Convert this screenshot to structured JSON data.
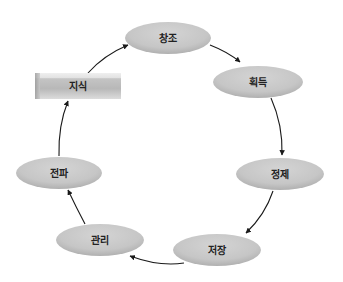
{
  "diagram": {
    "start_node": {
      "id": "knowledge",
      "label": "지식",
      "shape": "beveled-box",
      "x": 35,
      "y": 73,
      "w": 86,
      "h": 26
    },
    "cycle_nodes": [
      {
        "id": "creation",
        "label": "창조",
        "cx": 168,
        "cy": 38,
        "rx": 43,
        "ry": 16
      },
      {
        "id": "acquisition",
        "label": "획득",
        "cx": 258,
        "cy": 82,
        "rx": 45,
        "ry": 16
      },
      {
        "id": "refinement",
        "label": "정제",
        "cx": 280,
        "cy": 174,
        "rx": 44,
        "ry": 16
      },
      {
        "id": "storage",
        "label": "저장",
        "cx": 217,
        "cy": 250,
        "rx": 44,
        "ry": 16
      },
      {
        "id": "management",
        "label": "관리",
        "cx": 100,
        "cy": 240,
        "rx": 44,
        "ry": 16
      },
      {
        "id": "distribution",
        "label": "전파",
        "cx": 59,
        "cy": 173,
        "rx": 43,
        "ry": 16
      }
    ],
    "edges": [
      {
        "from": "knowledge",
        "to": "creation"
      },
      {
        "from": "creation",
        "to": "acquisition"
      },
      {
        "from": "acquisition",
        "to": "refinement"
      },
      {
        "from": "refinement",
        "to": "storage"
      },
      {
        "from": "storage",
        "to": "management"
      },
      {
        "from": "management",
        "to": "distribution"
      },
      {
        "from": "distribution",
        "to": "knowledge"
      }
    ],
    "colors": {
      "ellipse_fill": "#c9c9c9",
      "ellipse_shadow": "#b3b3b3",
      "box_top": "#e6e6e6",
      "box_body": "#bdbdbd",
      "arrow": "#1a1a1a",
      "text": "#222222"
    }
  }
}
